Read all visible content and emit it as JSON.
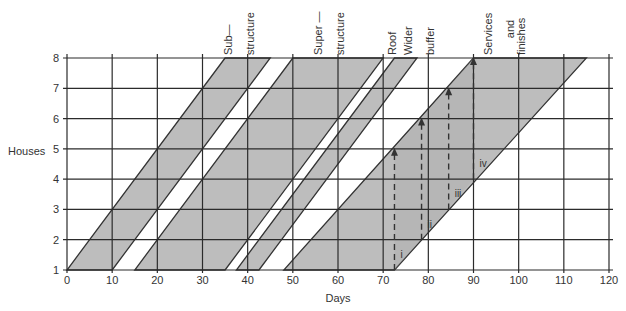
{
  "chart_data": {
    "type": "line-of-balance",
    "title": "",
    "xlabel": "Days",
    "ylabel": "Houses",
    "xlim": [
      0,
      120
    ],
    "ylim": [
      1,
      8
    ],
    "x_ticks": [
      0,
      10,
      20,
      30,
      40,
      50,
      60,
      70,
      80,
      90,
      100,
      110,
      120
    ],
    "y_ticks": [
      1,
      2,
      3,
      4,
      5,
      6,
      7,
      8
    ],
    "grid": true,
    "slope_days_per_house": 5,
    "bands": [
      {
        "name": "Sub-structure",
        "start_house1": 0,
        "end_house1": 10,
        "start_house8": 35,
        "end_house8": 45
      },
      {
        "name": "Super-structure",
        "start_house1": 15,
        "end_house1": 35,
        "start_house8": 50,
        "end_house8": 70
      },
      {
        "name": "Roof",
        "start_house1": 37.5,
        "end_house1": 42.5,
        "start_house8": 72.5,
        "end_house8": 77.5
      },
      {
        "name": "Services and finishes",
        "start_house1": 48,
        "end_house1": 72.5,
        "start_house8": 90,
        "end_house8": 115
      }
    ],
    "buffer_arrows": [
      {
        "label": "i",
        "day": 72.5,
        "from_house": 1,
        "to_house": 5
      },
      {
        "label": "ii",
        "day": 78.5,
        "from_house": 2,
        "to_house": 6
      },
      {
        "label": "iii",
        "day": 84.5,
        "from_house": 3,
        "to_house": 7
      },
      {
        "label": "iv",
        "day": 90,
        "from_house": 4,
        "to_house": 8
      }
    ],
    "annotations": [
      {
        "text": [
          "Sub—",
          "structure"
        ],
        "day": 40
      },
      {
        "text": [
          "Super —",
          "structure"
        ],
        "day": 60
      },
      {
        "text": [
          "Roof"
        ],
        "day": 70
      },
      {
        "text": [
          "Wider",
          "buffer"
        ],
        "day": 80
      },
      {
        "text": [
          "Services",
          "and",
          "finishes"
        ],
        "day": 100
      }
    ],
    "colors": {
      "band_fill": "#bdbdbd",
      "band_fill_dark": "#a9a9a9",
      "grid": "#2b2b2b"
    }
  },
  "axes": {
    "x_title": "Days",
    "y_title": "Houses"
  }
}
